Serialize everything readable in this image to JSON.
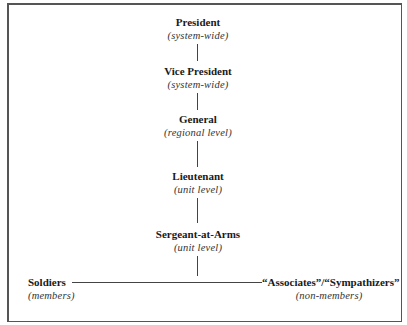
{
  "diagram": {
    "type": "org-chart-hierarchy",
    "nodes": [
      {
        "id": "president",
        "title": "President",
        "scope": "(system-wide)"
      },
      {
        "id": "vice-president",
        "title": "Vice President",
        "scope": "(system-wide)"
      },
      {
        "id": "general",
        "title": "General",
        "scope": "(regional level)"
      },
      {
        "id": "lieutenant",
        "title": "Lieutenant",
        "scope": "(unit level)"
      },
      {
        "id": "sergeant-at-arms",
        "title": "Sergeant-at-Arms",
        "scope": "(unit level)"
      },
      {
        "id": "soldiers",
        "title": "Soldiers",
        "scope": "(members)"
      },
      {
        "id": "associates",
        "title": "“Associates”/“Sympathizers”",
        "scope": "(non-members)"
      }
    ],
    "edges": [
      [
        "president",
        "vice-president"
      ],
      [
        "vice-president",
        "general"
      ],
      [
        "general",
        "lieutenant"
      ],
      [
        "lieutenant",
        "sergeant-at-arms"
      ],
      [
        "sergeant-at-arms",
        "soldiers"
      ],
      [
        "sergeant-at-arms",
        "associates"
      ]
    ]
  }
}
